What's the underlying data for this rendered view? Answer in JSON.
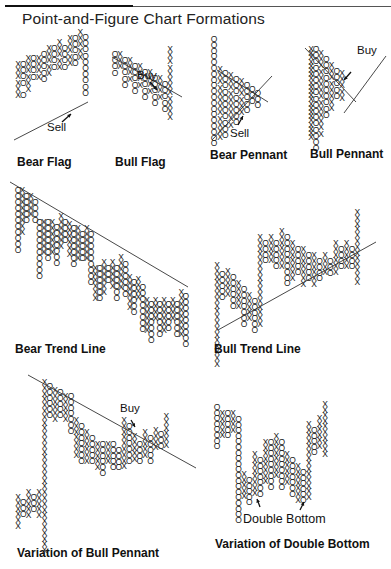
{
  "header": {
    "title": "Point-and-Figure Chart Formations"
  },
  "panels": [
    {
      "id": "bear-flag",
      "label": "Bear Flag",
      "annotation": "Sell"
    },
    {
      "id": "bull-flag",
      "label": "Bull Flag",
      "annotation": "Buy"
    },
    {
      "id": "bear-pennant",
      "label": "Bear Pennant",
      "annotation": "Sell"
    },
    {
      "id": "bull-pennant",
      "label": "Bull Pennant",
      "annotation": "Buy"
    },
    {
      "id": "bear-trend-line",
      "label": "Bear Trend Line",
      "annotation": ""
    },
    {
      "id": "bull-trend-line",
      "label": "Bull Trend Line",
      "annotation": ""
    },
    {
      "id": "variation-bull-pennant",
      "label": "Variation of Bull Pennant",
      "annotation": "Buy"
    },
    {
      "id": "variation-double-bottom",
      "label": "Variation of Double Bottom",
      "annotation": "Double Bottom"
    }
  ],
  "chart_data": {
    "type": "point-and-figure",
    "title": "Point-and-Figure Chart Formations",
    "symbols": {
      "rising": "X",
      "falling": "O"
    },
    "formations": [
      {
        "name": "Bear Flag",
        "signal": "Sell",
        "trendline": "rising"
      },
      {
        "name": "Bull Flag",
        "signal": "Buy",
        "trendline": "falling"
      },
      {
        "name": "Bear Pennant",
        "signal": "Sell",
        "trendline": "converging"
      },
      {
        "name": "Bull Pennant",
        "signal": "Buy",
        "trendline": "converging"
      },
      {
        "name": "Bear Trend Line",
        "signal": "",
        "trendline": "falling"
      },
      {
        "name": "Bull Trend Line",
        "signal": "",
        "trendline": "rising"
      },
      {
        "name": "Variation of Bull Pennant",
        "signal": "Buy",
        "trendline": "falling"
      },
      {
        "name": "Variation of Double Bottom",
        "signal": "Double Bottom",
        "trendline": "none"
      }
    ]
  }
}
